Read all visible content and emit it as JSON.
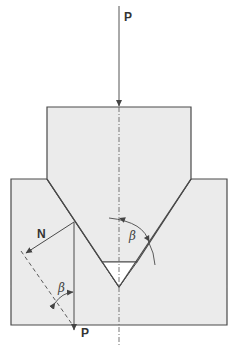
{
  "diagram": {
    "colors": {
      "fill": "#ebebeb",
      "stroke": "#4a4a4a",
      "background": "#ffffff",
      "triangle_gap": "#ffffff"
    },
    "labels": {
      "load_top": "P",
      "load_bottom": "P",
      "normal_force": "N",
      "angle_left": "β",
      "angle_right": "β"
    },
    "elements": [
      {
        "name": "upper-wedge-punch",
        "type": "polygon"
      },
      {
        "name": "lower-die-block",
        "type": "polygon"
      },
      {
        "name": "centerline",
        "type": "dash-dot line"
      },
      {
        "name": "load-arrow-top",
        "label": "P"
      },
      {
        "name": "normal-force-arrow",
        "label": "N"
      },
      {
        "name": "vertical-load-arrow",
        "label": "P"
      },
      {
        "name": "perpendicular-dashed-line"
      },
      {
        "name": "angle-arc-left",
        "label": "β"
      },
      {
        "name": "angle-arc-right",
        "label": "β"
      },
      {
        "name": "gap-triangle"
      }
    ]
  }
}
